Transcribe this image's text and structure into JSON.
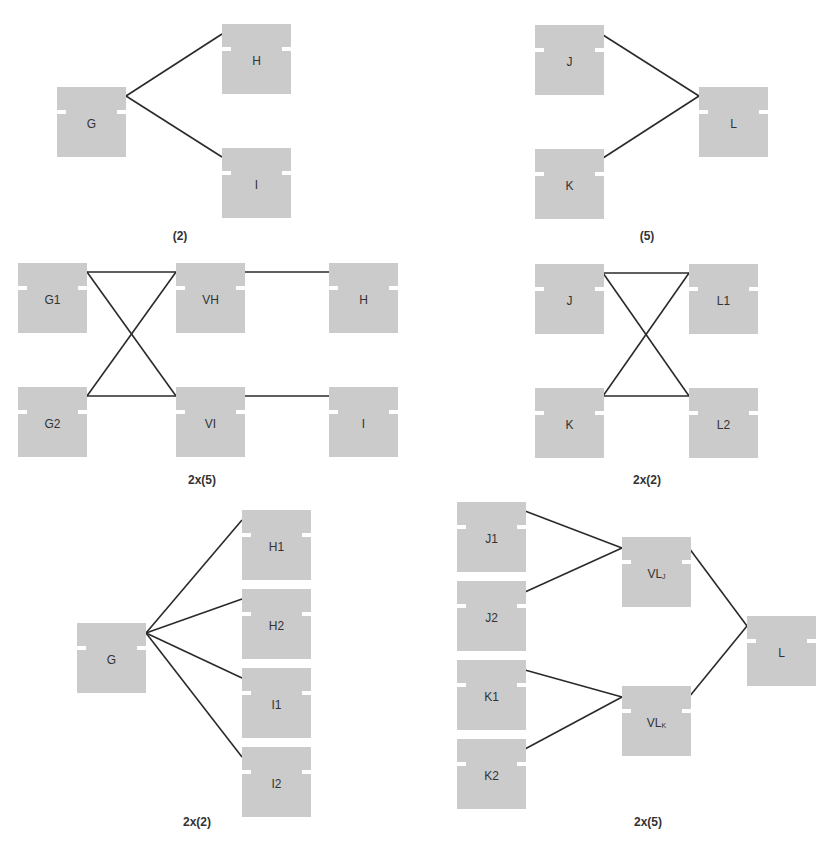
{
  "diagram": {
    "node_size": {
      "w": 69,
      "h": 70
    },
    "colors": {
      "node_fill": "#cbcbcb",
      "edge": "#2a2a2a",
      "label": "#333333",
      "background": "#ffffff"
    },
    "panels": [
      {
        "id": "top-left",
        "caption": "(2)",
        "caption_pos": {
          "x": 180,
          "y": 229
        },
        "nodes": [
          {
            "id": "G",
            "label": "G",
            "sub": "",
            "x": 57,
            "y": 87
          },
          {
            "id": "H",
            "label": "H",
            "sub": "",
            "x": 222,
            "y": 24
          },
          {
            "id": "I",
            "label": "I",
            "sub": "",
            "x": 222,
            "y": 148
          }
        ],
        "edges": [
          {
            "from": "G",
            "to": "H",
            "x1": 126,
            "y1": 96,
            "x2": 222,
            "y2": 34
          },
          {
            "from": "G",
            "to": "I",
            "x1": 126,
            "y1": 96,
            "x2": 222,
            "y2": 157
          }
        ]
      },
      {
        "id": "top-right",
        "caption": "(5)",
        "caption_pos": {
          "x": 647,
          "y": 229
        },
        "nodes": [
          {
            "id": "J",
            "label": "J",
            "sub": "",
            "x": 535,
            "y": 25
          },
          {
            "id": "K",
            "label": "K",
            "sub": "",
            "x": 535,
            "y": 149
          },
          {
            "id": "L",
            "label": "L",
            "sub": "",
            "x": 699,
            "y": 87
          }
        ],
        "edges": [
          {
            "from": "J",
            "to": "L",
            "x1": 603,
            "y1": 35,
            "x2": 699,
            "y2": 96
          },
          {
            "from": "K",
            "to": "L",
            "x1": 603,
            "y1": 158,
            "x2": 699,
            "y2": 96
          }
        ]
      },
      {
        "id": "middle-left",
        "caption": "2x(5)",
        "caption_pos": {
          "x": 202,
          "y": 473
        },
        "nodes": [
          {
            "id": "G1",
            "label": "G1",
            "sub": "",
            "x": 18,
            "y": 263
          },
          {
            "id": "G2",
            "label": "G2",
            "sub": "",
            "x": 18,
            "y": 387
          },
          {
            "id": "VH",
            "label": "VH",
            "sub": "",
            "x": 176,
            "y": 263
          },
          {
            "id": "VI",
            "label": "VI",
            "sub": "",
            "x": 176,
            "y": 387
          },
          {
            "id": "H",
            "label": "H",
            "sub": "",
            "x": 329,
            "y": 263
          },
          {
            "id": "I",
            "label": "I",
            "sub": "",
            "x": 329,
            "y": 387
          }
        ],
        "edges": [
          {
            "from": "G1",
            "to": "VH",
            "x1": 87,
            "y1": 272,
            "x2": 176,
            "y2": 272
          },
          {
            "from": "G1",
            "to": "VI",
            "x1": 87,
            "y1": 272,
            "x2": 176,
            "y2": 396
          },
          {
            "from": "G2",
            "to": "VH",
            "x1": 87,
            "y1": 396,
            "x2": 176,
            "y2": 272
          },
          {
            "from": "G2",
            "to": "VI",
            "x1": 87,
            "y1": 396,
            "x2": 176,
            "y2": 396
          },
          {
            "from": "VH",
            "to": "H",
            "x1": 243,
            "y1": 272,
            "x2": 329,
            "y2": 272
          },
          {
            "from": "VI",
            "to": "I",
            "x1": 243,
            "y1": 396,
            "x2": 329,
            "y2": 396
          }
        ]
      },
      {
        "id": "middle-right",
        "caption": "2x(2)",
        "caption_pos": {
          "x": 647,
          "y": 473
        },
        "nodes": [
          {
            "id": "J",
            "label": "J",
            "sub": "",
            "x": 535,
            "y": 264
          },
          {
            "id": "K",
            "label": "K",
            "sub": "",
            "x": 535,
            "y": 388
          },
          {
            "id": "L1",
            "label": "L1",
            "sub": "",
            "x": 689,
            "y": 264
          },
          {
            "id": "L2",
            "label": "L2",
            "sub": "",
            "x": 689,
            "y": 388
          }
        ],
        "edges": [
          {
            "from": "J",
            "to": "L1",
            "x1": 603,
            "y1": 273,
            "x2": 689,
            "y2": 273
          },
          {
            "from": "J",
            "to": "L2",
            "x1": 603,
            "y1": 273,
            "x2": 689,
            "y2": 396
          },
          {
            "from": "K",
            "to": "L1",
            "x1": 603,
            "y1": 396,
            "x2": 689,
            "y2": 273
          },
          {
            "from": "K",
            "to": "L2",
            "x1": 603,
            "y1": 396,
            "x2": 689,
            "y2": 396
          }
        ]
      },
      {
        "id": "bottom-left",
        "caption": "2x(2)",
        "caption_pos": {
          "x": 197,
          "y": 815
        },
        "nodes": [
          {
            "id": "G",
            "label": "G",
            "sub": "",
            "x": 77,
            "y": 623
          },
          {
            "id": "H1",
            "label": "H1",
            "sub": "",
            "x": 242,
            "y": 510
          },
          {
            "id": "H2",
            "label": "H2",
            "sub": "",
            "x": 242,
            "y": 589
          },
          {
            "id": "I1",
            "label": "I1",
            "sub": "",
            "x": 242,
            "y": 668
          },
          {
            "id": "I2",
            "label": "I2",
            "sub": "",
            "x": 242,
            "y": 747
          }
        ],
        "edges": [
          {
            "from": "G",
            "to": "H1",
            "x1": 146,
            "y1": 633,
            "x2": 242,
            "y2": 520
          },
          {
            "from": "G",
            "to": "H2",
            "x1": 146,
            "y1": 633,
            "x2": 242,
            "y2": 599
          },
          {
            "from": "G",
            "to": "I1",
            "x1": 146,
            "y1": 633,
            "x2": 242,
            "y2": 678
          },
          {
            "from": "G",
            "to": "I2",
            "x1": 146,
            "y1": 633,
            "x2": 242,
            "y2": 757
          }
        ]
      },
      {
        "id": "bottom-right",
        "caption": "2x(5)",
        "caption_pos": {
          "x": 648,
          "y": 815
        },
        "nodes": [
          {
            "id": "J1",
            "label": "J1",
            "sub": "",
            "x": 457,
            "y": 502
          },
          {
            "id": "J2",
            "label": "J2",
            "sub": "",
            "x": 457,
            "y": 581
          },
          {
            "id": "K1",
            "label": "K1",
            "sub": "",
            "x": 457,
            "y": 660
          },
          {
            "id": "K2",
            "label": "K2",
            "sub": "",
            "x": 457,
            "y": 739
          },
          {
            "id": "VLJ",
            "label": "VL",
            "sub": "J",
            "x": 622,
            "y": 537
          },
          {
            "id": "VLK",
            "label": "VL",
            "sub": "K",
            "x": 622,
            "y": 686
          },
          {
            "id": "L",
            "label": "L",
            "sub": "",
            "x": 747,
            "y": 616
          }
        ],
        "edges": [
          {
            "from": "J1",
            "to": "VLJ",
            "x1": 525,
            "y1": 511,
            "x2": 622,
            "y2": 548
          },
          {
            "from": "J2",
            "to": "VLJ",
            "x1": 525,
            "y1": 592,
            "x2": 622,
            "y2": 548
          },
          {
            "from": "K1",
            "to": "VLK",
            "x1": 525,
            "y1": 670,
            "x2": 622,
            "y2": 697
          },
          {
            "from": "K2",
            "to": "VLK",
            "x1": 525,
            "y1": 749,
            "x2": 622,
            "y2": 697
          },
          {
            "from": "VLJ",
            "to": "L",
            "x1": 689,
            "y1": 548,
            "x2": 747,
            "y2": 626
          },
          {
            "from": "VLK",
            "to": "L",
            "x1": 689,
            "y1": 697,
            "x2": 747,
            "y2": 626
          }
        ]
      }
    ]
  }
}
